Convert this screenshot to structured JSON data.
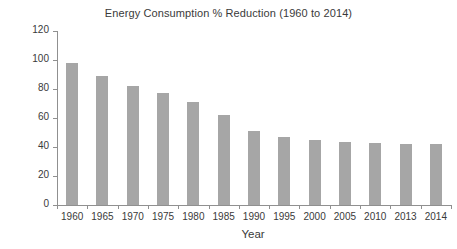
{
  "chart_data": {
    "type": "bar",
    "title": "Energy Consumption % Reduction (1960 to 2014)",
    "xlabel": "Year",
    "ylabel": "Energy Consumption",
    "categories": [
      "1960",
      "1965",
      "1970",
      "1975",
      "1980",
      "1985",
      "1990",
      "1995",
      "2000",
      "2005",
      "2010",
      "2013",
      "2014"
    ],
    "values": [
      98,
      89,
      82,
      77,
      71,
      62,
      51,
      47,
      45,
      43.5,
      42.5,
      42,
      42
    ],
    "ylim": [
      0,
      120
    ],
    "ytick_values": [
      0,
      20,
      40,
      60,
      80,
      100,
      120
    ],
    "ytick_labels": [
      "0",
      "20",
      "40",
      "60",
      "80",
      "100",
      "120"
    ],
    "grid": false,
    "legend": false,
    "bar_color": "#a6a6a6",
    "axis_color": "#909090",
    "text_color": "#3a3a3a",
    "background": "#ffffff"
  }
}
